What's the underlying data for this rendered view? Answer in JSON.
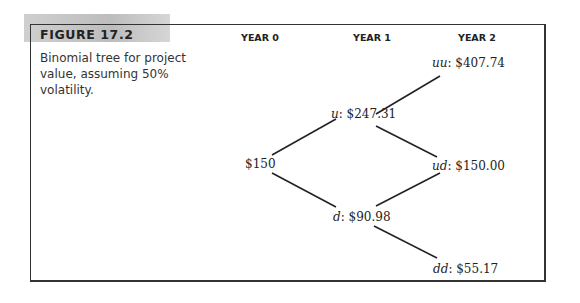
{
  "figure": {
    "label": "FIGURE 17.2",
    "caption": "Binomial tree for project value, assuming 50% volatility."
  },
  "columns": [
    {
      "label": "YEAR 0"
    },
    {
      "label": "YEAR 1"
    },
    {
      "label": "YEAR 2"
    }
  ],
  "nodes": {
    "root": {
      "prefix": "",
      "value": "$150"
    },
    "u": {
      "prefix": "u",
      "value": ": $247.31"
    },
    "d": {
      "prefix": "d",
      "value": ": $90.98"
    },
    "uu": {
      "prefix": "uu",
      "value": ": $407.74"
    },
    "ud": {
      "prefix": "ud",
      "value": ": $150.00"
    },
    "dd": {
      "prefix": "dd",
      "value": ": $55.17"
    }
  }
}
